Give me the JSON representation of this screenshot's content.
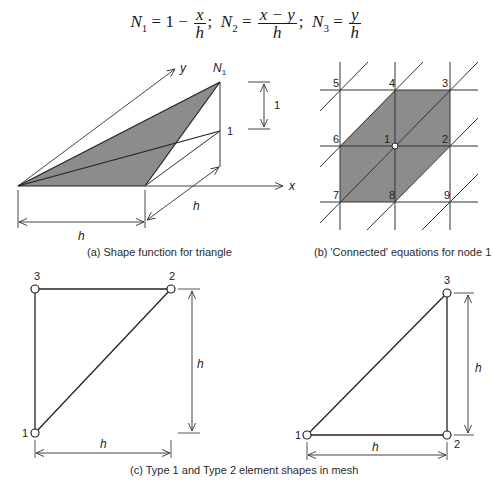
{
  "equation": {
    "n1_label": "N",
    "n1_sub": "1",
    "n1_rhs_prefix": "= 1 −",
    "n1_num": "x",
    "n1_den": "h",
    "sep1": ";",
    "n2_label": "N",
    "n2_sub": "2",
    "n2_eq": "=",
    "n2_num": "x − y",
    "n2_den": "h",
    "sep2": ";",
    "n3_label": "N",
    "n3_sub": "3",
    "n3_eq": "=",
    "n3_num": "y",
    "n3_den": "h"
  },
  "panel_a": {
    "caption": "(a) Shape function for triangle",
    "axis_x": "x",
    "axis_y": "y",
    "peak_label": "N1",
    "peak_label_main": "N",
    "peak_label_sub": "1",
    "height_label": "1",
    "unit_dim_label": "1",
    "dim_h_bottom": "h",
    "dim_h_diag": "h"
  },
  "panel_b": {
    "caption": "(b) 'Connected' equations for node 1",
    "nodes": [
      "1",
      "2",
      "3",
      "4",
      "5",
      "6",
      "7",
      "8",
      "9"
    ]
  },
  "panel_c": {
    "caption": "(c) Type 1 and Type 2 element shapes in mesh",
    "type1": {
      "nodes": [
        "1",
        "2",
        "3"
      ],
      "dim_horizontal": "h",
      "dim_vertical": "h"
    },
    "type2": {
      "nodes": [
        "1",
        "2",
        "3"
      ],
      "dim_horizontal": "h",
      "dim_vertical": "h"
    }
  },
  "colors": {
    "shade": "#8c8c8c",
    "line": "#222222",
    "background": "#ffffff"
  }
}
